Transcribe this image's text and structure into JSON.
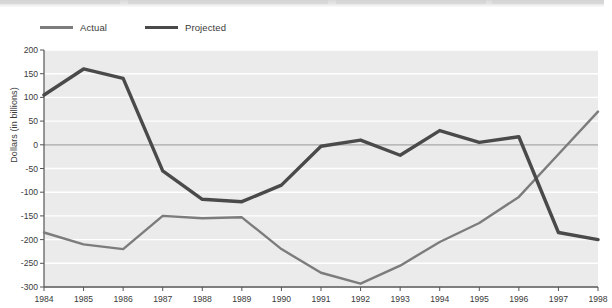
{
  "chart_data": {
    "type": "line",
    "title": "",
    "xlabel": "",
    "ylabel": "Dollars (in billions)",
    "x": [
      1984,
      1985,
      1986,
      1987,
      1988,
      1989,
      1990,
      1991,
      1992,
      1993,
      1994,
      1995,
      1996,
      1997,
      1998
    ],
    "xtick_labels": [
      "1984",
      "1985",
      "1986",
      "1987",
      "1988",
      "1989",
      "1990",
      "1991",
      "1992",
      "1993",
      "1994",
      "1995",
      "1996",
      "1997",
      "1998"
    ],
    "ytick_labels": [
      "200",
      "150",
      "100",
      "50",
      "0",
      "-50",
      "-100",
      "-150",
      "-200",
      "-250",
      "-300"
    ],
    "yticks": [
      200,
      150,
      100,
      50,
      0,
      -50,
      -100,
      -150,
      -200,
      -250,
      -300
    ],
    "ylim": [
      -300,
      200
    ],
    "xlim": [
      1984,
      1998
    ],
    "grid": true,
    "grid_color": "#ffffff",
    "zero_line_color": "#a8a8a8",
    "plot_background": "#ebebeb",
    "legend_position": "above-left",
    "series": [
      {
        "name": "Actual",
        "color": "#7c7c7c",
        "width": 2.4,
        "values": [
          -185,
          -210,
          -220,
          -150,
          -155,
          -153,
          -220,
          -270,
          -293,
          -255,
          -205,
          -165,
          -110,
          -20,
          70
        ]
      },
      {
        "name": "Projected",
        "color": "#4a4a4a",
        "width": 3.4,
        "values": [
          105,
          160,
          140,
          -55,
          -115,
          -120,
          -85,
          -3,
          10,
          -22,
          30,
          5,
          17,
          -185,
          -200
        ]
      }
    ]
  },
  "legend": {
    "items": [
      {
        "label": "Actual",
        "key": "actual"
      },
      {
        "label": "Projected",
        "key": "projected"
      }
    ]
  },
  "colors": {
    "actual": "#7c7c7c",
    "projected": "#4a4a4a",
    "axis": "#555555",
    "plot_bg": "#ebebeb",
    "gridline": "#ffffff",
    "zero_line": "#a8a8a8",
    "text": "#3a3a3a",
    "top_band": "#d9d9d9"
  }
}
